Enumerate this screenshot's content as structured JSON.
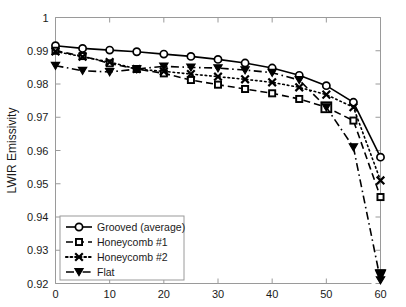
{
  "chart_data": {
    "type": "line",
    "title": "",
    "xlabel": "",
    "ylabel": "LWIR Emissivity",
    "xlim": [
      0,
      60
    ],
    "ylim": [
      0.92,
      1.0
    ],
    "xticks": [
      0,
      10,
      20,
      30,
      40,
      50,
      60
    ],
    "yticks": [
      0.92,
      0.93,
      0.94,
      0.95,
      0.96,
      0.97,
      0.98,
      0.99,
      1
    ],
    "xtick_labels": [
      "0",
      "10",
      "20",
      "30",
      "40",
      "50",
      "60"
    ],
    "ytick_labels": [
      "0.92",
      "0.93",
      "0.94",
      "0.95",
      "0.96",
      "0.97",
      "0.98",
      "0.99",
      "1"
    ],
    "grid": false,
    "legend_position": "lower-left",
    "x": [
      0,
      5,
      10,
      15,
      20,
      25,
      30,
      35,
      40,
      45,
      50,
      55,
      60
    ],
    "series": [
      {
        "name": "Grooved (average)",
        "marker": "circle-open",
        "linestyle": "solid",
        "values": [
          0.9915,
          0.9907,
          0.9902,
          0.9897,
          0.989,
          0.9883,
          0.9874,
          0.9863,
          0.9848,
          0.9826,
          0.9795,
          0.9745,
          0.958
        ]
      },
      {
        "name": "Honeycomb #1",
        "marker": "square-filled",
        "linestyle": "dashed",
        "values": [
          0.99,
          0.9884,
          0.9862,
          0.9845,
          0.9832,
          0.9812,
          0.9798,
          0.9785,
          0.9772,
          0.9755,
          0.973,
          0.969,
          0.946
        ]
      },
      {
        "name": "Honeycomb #2",
        "marker": "x",
        "linestyle": "dotted",
        "values": [
          0.9898,
          0.9882,
          0.9866,
          0.9845,
          0.9838,
          0.983,
          0.9822,
          0.9814,
          0.9805,
          0.979,
          0.9768,
          0.973,
          0.951
        ]
      },
      {
        "name": "Flat",
        "marker": "triangle-down-filled",
        "linestyle": "dash-dot",
        "values": [
          0.9855,
          0.984,
          0.9836,
          0.9845,
          0.9853,
          0.985,
          0.9848,
          0.9842,
          0.9834,
          0.9812,
          0.973,
          0.961,
          0.921
        ]
      }
    ]
  },
  "axes": {
    "y_title": "LWIR Emissivity"
  },
  "legend": {
    "items": [
      {
        "label": "Grooved (average)"
      },
      {
        "label": "Honeycomb #1"
      },
      {
        "label": "Honeycomb #2"
      },
      {
        "label": "Flat"
      }
    ]
  }
}
